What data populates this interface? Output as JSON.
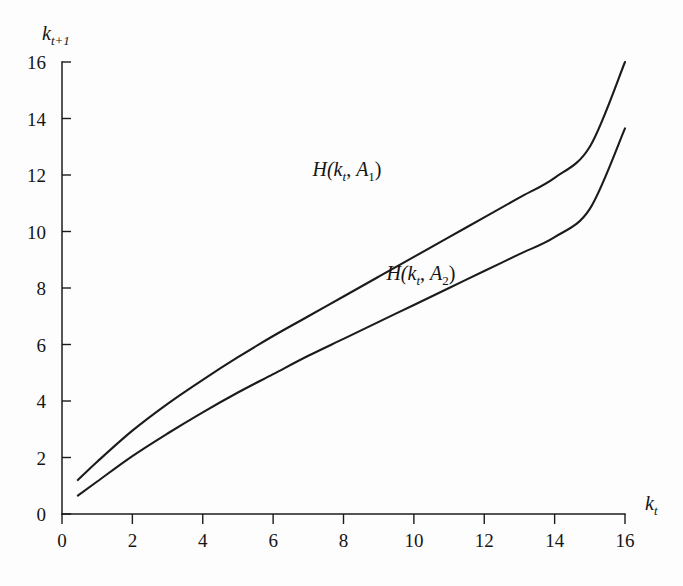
{
  "figure": {
    "background_color": "#fdfdfd",
    "ink_color": "#1b1b1b"
  },
  "chart_data": {
    "type": "line",
    "title": "",
    "subtitle": "",
    "xlabel": "k_t",
    "ylabel": "k_{t+1}",
    "xlabel_parts": {
      "base": "k",
      "sub": "t"
    },
    "ylabel_parts": {
      "base": "k",
      "sub": "t+1"
    },
    "xlim": [
      0,
      16
    ],
    "ylim": [
      0,
      16
    ],
    "xticks": [
      0,
      2,
      4,
      6,
      8,
      10,
      12,
      14,
      16
    ],
    "yticks": [
      0,
      2,
      4,
      6,
      8,
      10,
      12,
      14,
      16
    ],
    "xticklabels": [
      "0",
      "2",
      "4",
      "6",
      "8",
      "10",
      "12",
      "14",
      "16"
    ],
    "yticklabels": [
      "0",
      "2",
      "4",
      "6",
      "8",
      "10",
      "12",
      "14",
      "16"
    ],
    "grid": false,
    "legend": "inline-annotations",
    "legend_position": "inside-plot",
    "x": [
      0.45,
      1,
      2,
      3,
      4,
      5,
      6,
      7,
      8,
      9,
      10,
      11,
      12,
      13,
      14,
      15,
      16
    ],
    "series": [
      {
        "name": "H(k_t, A_1)",
        "label_base": "H(",
        "label_arg1": "k",
        "label_arg1_sub": "t",
        "label_sep": ", ",
        "label_arg2": "A",
        "label_arg2_sub": "1",
        "label_close": ")",
        "color": "#1b1b1b",
        "values": [
          1.2,
          1.85,
          2.95,
          3.9,
          4.75,
          5.55,
          6.3,
          7.0,
          7.7,
          8.4,
          9.1,
          9.8,
          10.5,
          11.2,
          11.9,
          13.0,
          16.0
        ]
      },
      {
        "name": "H(k_t, A_2)",
        "label_base": "H(",
        "label_arg1": "k",
        "label_arg1_sub": "t",
        "label_sep": ", ",
        "label_arg2": "A",
        "label_arg2_sub": "2",
        "label_close": ")",
        "color": "#1b1b1b",
        "values": [
          0.65,
          1.15,
          2.05,
          2.85,
          3.6,
          4.3,
          4.95,
          5.6,
          6.2,
          6.8,
          7.4,
          8.0,
          8.6,
          9.2,
          9.8,
          10.8,
          13.65
        ]
      }
    ],
    "annotations": [
      {
        "text": "H(k_t, A_1)",
        "x_data": 8.1,
        "y_data": 11.95,
        "series": 0
      },
      {
        "text": "H(k_t, A_2)",
        "x_data": 10.2,
        "y_data": 8.3,
        "series": 1
      }
    ],
    "axis_geometry": {
      "plot_left_px": 62,
      "plot_right_px": 625,
      "plot_bottom_px": 514,
      "plot_top_px": 62
    }
  }
}
